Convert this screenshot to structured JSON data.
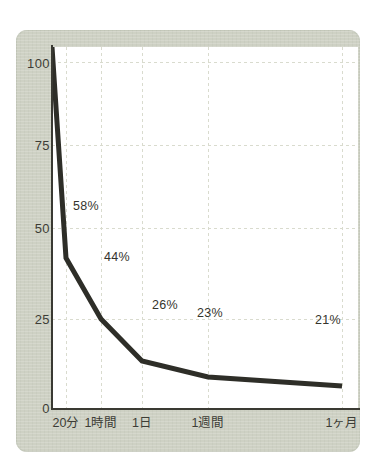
{
  "chart_data": {
    "type": "line",
    "title": "",
    "subtitle": "",
    "xlabel": "",
    "ylabel": "",
    "grid": true,
    "legend": "none",
    "ylim": [
      0,
      100
    ],
    "y_ticks": [
      "0",
      "25",
      "50",
      "75",
      "100"
    ],
    "y_tick_values": [
      0,
      25,
      50,
      75,
      100
    ],
    "categories": [
      "20分",
      "1時間",
      "1日",
      "1週間",
      "1ヶ月"
    ],
    "x_tick_labels": [
      "20分",
      "1時間",
      "1日",
      "1週間",
      "1ヶ月"
    ],
    "values": [
      58,
      44,
      26,
      23,
      21
    ],
    "point_labels": [
      "58%",
      "44%",
      "26%",
      "23%",
      "21%"
    ],
    "origin_value": 100,
    "series": [
      {
        "name": "",
        "x": [
          0,
          1,
          2,
          3,
          4,
          5
        ],
        "x_labels": [
          "",
          "20分",
          "1時間",
          "1日",
          "1週間",
          "1ヶ月"
        ],
        "values": [
          100,
          58,
          44,
          26,
          23,
          21
        ]
      }
    ],
    "colors": {
      "line": "#2e2e28",
      "panel": "#ced1c4",
      "plot_background": "#ffffff",
      "axis": "#3a3a33",
      "grid": "#d8dacd",
      "text": "#3d3d36"
    }
  },
  "y_ticks": [
    {
      "label": "100",
      "top": 56
    },
    {
      "label": "75",
      "top": 138
    },
    {
      "label": "50",
      "top": 221
    },
    {
      "label": "25",
      "top": 312
    },
    {
      "label": "0",
      "top": 401
    }
  ],
  "x_ticks": [
    {
      "label": "20分",
      "left": 66
    },
    {
      "label": "1時間",
      "left": 101
    },
    {
      "label": "1日",
      "left": 142
    },
    {
      "label": "1週間",
      "left": 208
    },
    {
      "label": "1ヶ月",
      "left": 342
    }
  ],
  "point_labels": [
    {
      "text": "58%",
      "left": 73,
      "top": 199
    },
    {
      "text": "44%",
      "left": 104,
      "top": 250
    },
    {
      "text": "26%",
      "left": 152,
      "top": 298
    },
    {
      "text": "23%",
      "left": 197,
      "top": 306
    },
    {
      "text": "21%",
      "left": 315,
      "top": 313
    }
  ]
}
